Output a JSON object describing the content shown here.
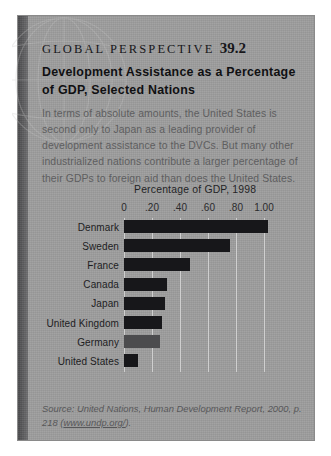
{
  "box": {
    "kicker_text": "GLOBAL PERSPECTIVE",
    "kicker_number": "39.2",
    "headline": "Development Assistance as a Percentage of GDP, Selected Nations",
    "body": "In terms of absolute amounts, the United States is second only to Japan as a leading provider of development assistance to the DVCs. But many other industrialized nations contribute a larger percentage of their GDPs to foreign aid than does the United States.",
    "watermark_icon": "globe-icon"
  },
  "source": {
    "prefix": "Source: United Nations, ",
    "work": "Human Development Report,",
    "middle": " 2000, p. 218 (",
    "url": "www.undp.org/",
    "suffix": ")."
  },
  "colors": {
    "panel": "#9d9d9d",
    "spine": "#555557",
    "bar": "#17171a",
    "bar_muted": "#4c4c4e",
    "gridline": "#cfcfcf",
    "page": "#ffffff"
  },
  "chart_data": {
    "type": "bar",
    "orientation": "horizontal",
    "title": "Percentage of GDP, 1998",
    "xlabel": "",
    "ylabel": "",
    "xlim": [
      0,
      1.0
    ],
    "grid": true,
    "legend": false,
    "tick_labels": [
      "0",
      ".20",
      ".40",
      ".60",
      ".80",
      "1.00"
    ],
    "tick_values": [
      0,
      0.2,
      0.4,
      0.6,
      0.8,
      1.0
    ],
    "categories": [
      "Denmark",
      "Sweden",
      "France",
      "Canada",
      "Japan",
      "United Kingdom",
      "Germany",
      "United States"
    ],
    "values": [
      1.03,
      0.76,
      0.47,
      0.31,
      0.29,
      0.27,
      0.26,
      0.1
    ]
  }
}
